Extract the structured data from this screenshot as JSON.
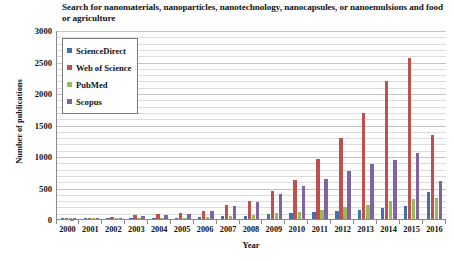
{
  "chart_data": {
    "type": "bar",
    "title": "Search for nanomaterials, nanoparticles, nanotechnology, nanocapsules, or nanoemulsions and food or agriculture",
    "xlabel": "Year",
    "ylabel": "Number of publications",
    "ylim": [
      0,
      3000
    ],
    "ytick_step": 500,
    "yticks": [
      3000,
      2500,
      2000,
      1500,
      1000,
      500,
      0
    ],
    "grid": true,
    "minor_grid_step": 100,
    "legend_position": "top-left-inside",
    "categories": [
      "2000",
      "2001",
      "2002",
      "2003",
      "2004",
      "2005",
      "2006",
      "2007",
      "2008",
      "2009",
      "2010",
      "2011",
      "2012",
      "2013",
      "2014",
      "2015",
      "2016"
    ],
    "series": [
      {
        "name": "ScienceDirect",
        "color": "#4472a8",
        "values": [
          2,
          3,
          5,
          8,
          12,
          18,
          28,
          40,
          55,
          75,
          95,
          110,
          130,
          150,
          175,
          205,
          430
        ]
      },
      {
        "name": "Web of Science",
        "color": "#c0504d",
        "values": [
          5,
          10,
          30,
          65,
          75,
          95,
          125,
          215,
          290,
          450,
          620,
          960,
          1290,
          1680,
          2190,
          2550,
          1330
        ]
      },
      {
        "name": "PubMed",
        "color": "#9bbb59",
        "values": [
          2,
          3,
          6,
          10,
          14,
          20,
          30,
          45,
          60,
          90,
          115,
          150,
          185,
          230,
          290,
          310,
          330
        ]
      },
      {
        "name": "Scopus",
        "color": "#8064a2",
        "values": [
          3,
          8,
          20,
          45,
          60,
          85,
          120,
          200,
          270,
          400,
          530,
          640,
          760,
          880,
          930,
          1045,
          600
        ]
      }
    ]
  }
}
